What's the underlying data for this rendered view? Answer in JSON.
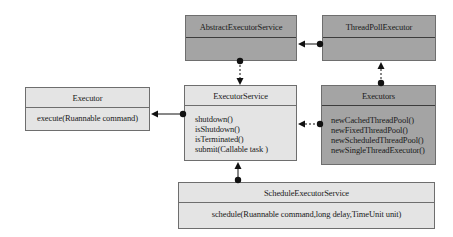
{
  "diagram": {
    "type": "uml-class-diagram",
    "colors": {
      "dark_box": "#a4a4a4",
      "light_box": "#e4e4e4",
      "border": "#6e6e6e",
      "connector": "#111111"
    },
    "classes": {
      "abstract_executor_service": {
        "name": "AbstractExecutorService",
        "methods": []
      },
      "thread_pool_executor": {
        "name": "ThreadPollExecutor",
        "methods": []
      },
      "executor": {
        "name": "Executor",
        "methods": [
          "execute(Ruannable command)"
        ]
      },
      "executor_service": {
        "name": "ExecutorService",
        "methods": [
          "shutdown()",
          "isShutdown()",
          "isTerminated()",
          "submit(Callable task )"
        ]
      },
      "executors": {
        "name": "Executors",
        "methods": [
          "newCachedThreadPool()",
          "newFixedThreadPool()",
          "newScheduledThreadPool()",
          "newSingleThreadExecutor()"
        ]
      },
      "schedule_executor_service": {
        "name": "ScheduleExecutorService",
        "methods": [
          "schedule(Ruannable command,long delay,TimeUnit unit)"
        ]
      }
    },
    "relations": [
      {
        "from": "AbstractExecutorService",
        "to": "ExecutorService",
        "style": "dashed"
      },
      {
        "from": "ThreadPollExecutor",
        "to": "AbstractExecutorService",
        "style": "solid"
      },
      {
        "from": "Executors",
        "to": "ThreadPollExecutor",
        "style": "dashed"
      },
      {
        "from": "ExecutorService",
        "to": "Executor",
        "style": "solid"
      },
      {
        "from": "Executors",
        "to": "ExecutorService",
        "style": "dashed"
      },
      {
        "from": "ScheduleExecutorService",
        "to": "ExecutorService",
        "style": "solid"
      }
    ]
  }
}
